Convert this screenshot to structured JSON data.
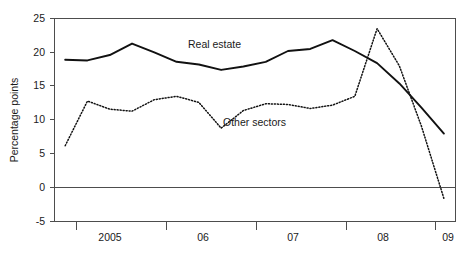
{
  "chart_data": {
    "type": "line",
    "title": "",
    "xlabel": "",
    "ylabel": "Percentage points",
    "ylim": [
      -5,
      25
    ],
    "xlim": [
      2004.5,
      2009.0
    ],
    "grid": false,
    "legend_position": "inline-annotations",
    "y_ticks": [
      "25",
      "20",
      "15",
      "10",
      "5",
      "0",
      "-5"
    ],
    "y_tick_values": [
      25,
      20,
      15,
      10,
      5,
      0,
      -5
    ],
    "x_ticks": [
      "2005",
      "06",
      "07",
      "08",
      "09"
    ],
    "x_tick_values": [
      2005,
      2006,
      2007,
      2008,
      2009
    ],
    "zero_line": 0,
    "series": [
      {
        "name": "Real estate",
        "style": "solid",
        "label": "Real estate",
        "x": [
          2004.62,
          2004.87,
          2005.12,
          2005.37,
          2005.62,
          2005.87,
          2006.12,
          2006.37,
          2006.62,
          2006.87,
          2007.12,
          2007.37,
          2007.62,
          2007.87,
          2008.12,
          2008.37,
          2008.62,
          2008.87
        ],
        "values": [
          18.9,
          18.8,
          19.6,
          21.3,
          20.0,
          18.6,
          18.2,
          17.4,
          17.9,
          18.6,
          20.2,
          20.5,
          21.8,
          20.2,
          18.4,
          15.4,
          11.8,
          8.0
        ]
      },
      {
        "name": "Other sectors",
        "style": "dotted",
        "label": "Other sectors",
        "x": [
          2004.62,
          2004.87,
          2005.12,
          2005.37,
          2005.62,
          2005.87,
          2006.12,
          2006.37,
          2006.62,
          2006.87,
          2007.12,
          2007.37,
          2007.62,
          2007.87,
          2008.12,
          2008.37,
          2008.62,
          2008.87
        ],
        "values": [
          6.2,
          12.8,
          11.6,
          11.3,
          13.0,
          13.5,
          12.6,
          8.8,
          11.4,
          12.4,
          12.3,
          11.7,
          12.2,
          13.5,
          23.5,
          18.0,
          9.0,
          -1.6
        ]
      }
    ],
    "annotations": [
      {
        "text": "Real estate",
        "x_px": 188,
        "y_px": 48
      },
      {
        "text": "Other sectors",
        "x_px": 223,
        "y_px": 126
      }
    ]
  }
}
